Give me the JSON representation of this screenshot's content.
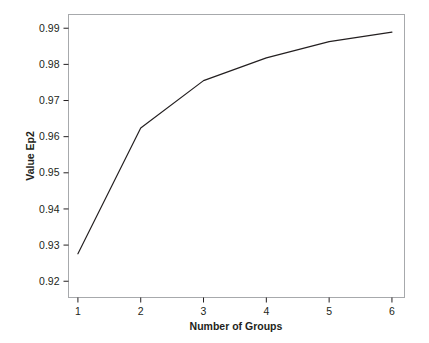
{
  "chart_data": {
    "type": "line",
    "title": "",
    "xlabel": "Number of Groups",
    "ylabel": "Value Ep2",
    "x": [
      1,
      2,
      3,
      4,
      5,
      6
    ],
    "values": [
      0.9276,
      0.9624,
      0.9755,
      0.9818,
      0.9863,
      0.9889
    ],
    "series": [
      {
        "name": "Value Ep2",
        "values": [
          0.9276,
          0.9624,
          0.9755,
          0.9818,
          0.9863,
          0.9889
        ]
      }
    ],
    "xticklabels": [
      "1",
      "2",
      "3",
      "4",
      "5",
      "6"
    ],
    "yticklabels": [
      "0.92",
      "0.93",
      "0.94",
      "0.95",
      "0.96",
      "0.97",
      "0.98",
      "0.99"
    ],
    "ytickvalues": [
      0.92,
      0.93,
      0.94,
      0.95,
      0.96,
      0.97,
      0.98,
      0.99
    ],
    "xlim": [
      0.85,
      6.2
    ],
    "ylim": [
      0.9155,
      0.9938
    ],
    "grid": false,
    "legend": false,
    "legend_position": "none",
    "line_color": "#231f20",
    "frame_color": "#a7a9ac",
    "background_color": "#ffffff"
  },
  "axes": {
    "x": {
      "title": "Number of Groups",
      "ticks": [
        {
          "label": "1"
        },
        {
          "label": "2"
        },
        {
          "label": "3"
        },
        {
          "label": "4"
        },
        {
          "label": "5"
        },
        {
          "label": "6"
        }
      ]
    },
    "y": {
      "title": "Value Ep2",
      "ticks": [
        {
          "label": "0.99"
        },
        {
          "label": "0.98"
        },
        {
          "label": "0.97"
        },
        {
          "label": "0.96"
        },
        {
          "label": "0.95"
        },
        {
          "label": "0.94"
        },
        {
          "label": "0.93"
        },
        {
          "label": "0.92"
        }
      ]
    }
  }
}
